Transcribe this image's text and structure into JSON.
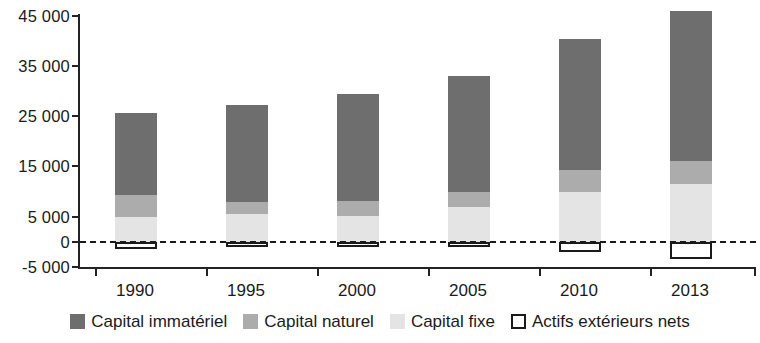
{
  "chart_data": {
    "type": "bar",
    "subtype": "stacked",
    "title": "",
    "xlabel": "",
    "ylabel": "",
    "categories": [
      "1990",
      "1995",
      "2000",
      "2005",
      "2010",
      "2013"
    ],
    "ylim": [
      -5000,
      45000
    ],
    "yticks": [
      -5000,
      0,
      5000,
      15000,
      25000,
      35000,
      45000
    ],
    "ytick_labels": [
      "-5 000",
      "0",
      "5 000",
      "15 000",
      "25 000",
      "35 000",
      "45 000"
    ],
    "grid": false,
    "zero_reference_line": true,
    "legend_position": "bottom",
    "series": [
      {
        "name": "Capital immatériel",
        "color": "#6e6e6e",
        "values": [
          16300,
          19300,
          21300,
          23100,
          26100,
          29700
        ]
      },
      {
        "name": "Capital naturel",
        "color": "#acacac",
        "values": [
          4400,
          2400,
          3000,
          3000,
          4400,
          4600
        ]
      },
      {
        "name": "Capital fixe",
        "color": "#e4e4e4",
        "values": [
          5000,
          5600,
          5200,
          7000,
          10000,
          11600
        ]
      },
      {
        "name": "Actifs extérieurs nets",
        "color": "#ffffff",
        "values": [
          -1300,
          -1000,
          -1000,
          -700,
          -2000,
          -3400
        ]
      }
    ],
    "totals_positive": [
      25700,
      27300,
      29500,
      33100,
      40500,
      45900
    ]
  },
  "axis": {
    "y_labels": [
      "45 000",
      "35 000",
      "25 000",
      "15 000",
      "5 000",
      "0",
      "-5 000"
    ],
    "x_labels": [
      "1990",
      "1995",
      "2000",
      "2005",
      "2010",
      "2013"
    ]
  },
  "legend": {
    "items": [
      {
        "label": "Capital immatériel",
        "swatch": "dark-gray-swatch"
      },
      {
        "label": "Capital naturel",
        "swatch": "medium-gray-swatch"
      },
      {
        "label": "Capital fixe",
        "swatch": "light-gray-swatch"
      },
      {
        "label": "Actifs extérieurs nets",
        "swatch": "outlined-white-swatch"
      }
    ]
  }
}
